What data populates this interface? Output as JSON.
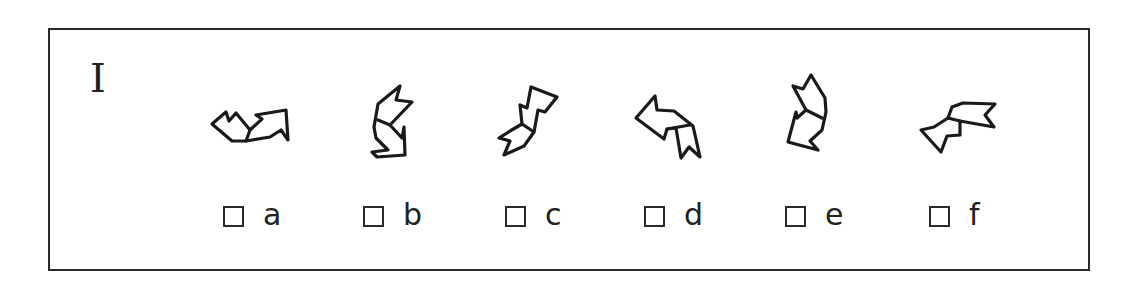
{
  "puzzle": {
    "section_label": "I",
    "frame_color": "#2a2a2a",
    "figures": [
      {
        "id": "a",
        "description": "bent arrow, notched tail at left, arrowhead pointing up-right"
      },
      {
        "id": "b",
        "description": "bent arrow, notched tail at top, arrowhead pointing down"
      },
      {
        "id": "c",
        "description": "bent arrow, notched tail at lower-left, arrowhead pointing up"
      },
      {
        "id": "d",
        "description": "bent arrow, notched tail at bottom-right, arrowhead pointing left"
      },
      {
        "id": "e",
        "description": "bent arrow, notched tail at top, arrowhead pointing down-left"
      },
      {
        "id": "f",
        "description": "bent arrow, notched tail at right, arrowhead pointing down-left"
      }
    ],
    "options": [
      {
        "label": "a",
        "checked": false
      },
      {
        "label": "b",
        "checked": false
      },
      {
        "label": "c",
        "checked": false
      },
      {
        "label": "d",
        "checked": false
      },
      {
        "label": "e",
        "checked": false
      },
      {
        "label": "f",
        "checked": false
      }
    ]
  }
}
